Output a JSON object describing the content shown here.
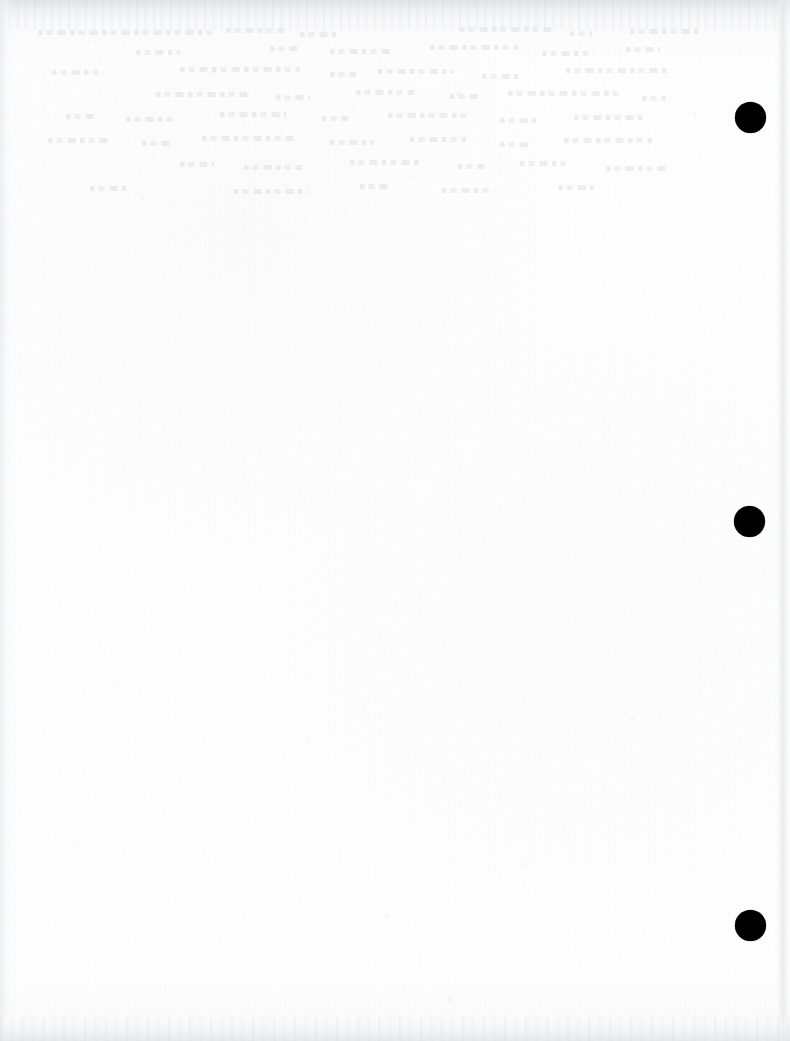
{
  "page": {
    "kind": "scanned-document-page",
    "content_text": "",
    "width_px": 790,
    "height_px": 1041,
    "background_color": "#ffffff"
  },
  "registration_marks": {
    "shape": "filled-circle",
    "color": "#000000",
    "count": 3,
    "diameter_px": 31,
    "items": [
      {
        "name": "registration-mark-top",
        "center_x": 750,
        "center_y": 117,
        "diameter": 31
      },
      {
        "name": "registration-mark-middle",
        "center_x": 749,
        "center_y": 521,
        "diameter": 31
      },
      {
        "name": "registration-mark-bottom",
        "center_x": 750,
        "center_y": 925,
        "diameter": 31
      }
    ]
  },
  "scan_artifacts": {
    "top_edge_shadow_color": "#dfe1e5",
    "bottom_edge_shadow_color": "#e6e7ea",
    "left_edge_shadow_color": "#ebeceF",
    "right_page_edge_color": "#e4e6ea",
    "paper_tint": "#fcfcfd",
    "grain_color": "#d2d4d8"
  },
  "showthrough": {
    "note": "faint illegible reverse-side text bleed in upper region",
    "ink_color": "#babdc4",
    "lines": [
      {
        "left": 8,
        "top": 4,
        "width": 174
      },
      {
        "left": 196,
        "top": 2,
        "width": 58
      },
      {
        "left": 270,
        "top": 6,
        "width": 36
      },
      {
        "left": 430,
        "top": 1,
        "width": 96
      },
      {
        "left": 540,
        "top": 5,
        "width": 22
      },
      {
        "left": 600,
        "top": 3,
        "width": 70
      },
      {
        "left": 106,
        "top": 24,
        "width": 44
      },
      {
        "left": 240,
        "top": 20,
        "width": 30
      },
      {
        "left": 300,
        "top": 23,
        "width": 62
      },
      {
        "left": 400,
        "top": 19,
        "width": 88
      },
      {
        "left": 512,
        "top": 25,
        "width": 52
      },
      {
        "left": 596,
        "top": 21,
        "width": 34
      },
      {
        "left": 22,
        "top": 44,
        "width": 52
      },
      {
        "left": 150,
        "top": 41,
        "width": 120
      },
      {
        "left": 300,
        "top": 46,
        "width": 26
      },
      {
        "left": 348,
        "top": 43,
        "width": 76
      },
      {
        "left": 452,
        "top": 48,
        "width": 40
      },
      {
        "left": 536,
        "top": 42,
        "width": 104
      },
      {
        "left": 126,
        "top": 66,
        "width": 92
      },
      {
        "left": 246,
        "top": 69,
        "width": 34
      },
      {
        "left": 326,
        "top": 64,
        "width": 58
      },
      {
        "left": 420,
        "top": 68,
        "width": 30
      },
      {
        "left": 478,
        "top": 65,
        "width": 114
      },
      {
        "left": 612,
        "top": 70,
        "width": 24
      },
      {
        "left": 36,
        "top": 88,
        "width": 30
      },
      {
        "left": 96,
        "top": 91,
        "width": 48
      },
      {
        "left": 190,
        "top": 86,
        "width": 66
      },
      {
        "left": 292,
        "top": 90,
        "width": 26
      },
      {
        "left": 358,
        "top": 87,
        "width": 82
      },
      {
        "left": 470,
        "top": 92,
        "width": 36
      },
      {
        "left": 544,
        "top": 89,
        "width": 70
      },
      {
        "left": 18,
        "top": 112,
        "width": 62
      },
      {
        "left": 112,
        "top": 115,
        "width": 28
      },
      {
        "left": 172,
        "top": 110,
        "width": 96
      },
      {
        "left": 300,
        "top": 114,
        "width": 44
      },
      {
        "left": 380,
        "top": 111,
        "width": 56
      },
      {
        "left": 470,
        "top": 116,
        "width": 30
      },
      {
        "left": 534,
        "top": 112,
        "width": 88
      },
      {
        "left": 150,
        "top": 136,
        "width": 34
      },
      {
        "left": 214,
        "top": 139,
        "width": 58
      },
      {
        "left": 320,
        "top": 134,
        "width": 72
      },
      {
        "left": 428,
        "top": 138,
        "width": 26
      },
      {
        "left": 490,
        "top": 135,
        "width": 46
      },
      {
        "left": 576,
        "top": 140,
        "width": 60
      },
      {
        "left": 60,
        "top": 160,
        "width": 40
      },
      {
        "left": 204,
        "top": 163,
        "width": 74
      },
      {
        "left": 330,
        "top": 158,
        "width": 30
      },
      {
        "left": 412,
        "top": 162,
        "width": 52
      },
      {
        "left": 528,
        "top": 159,
        "width": 36
      }
    ]
  }
}
